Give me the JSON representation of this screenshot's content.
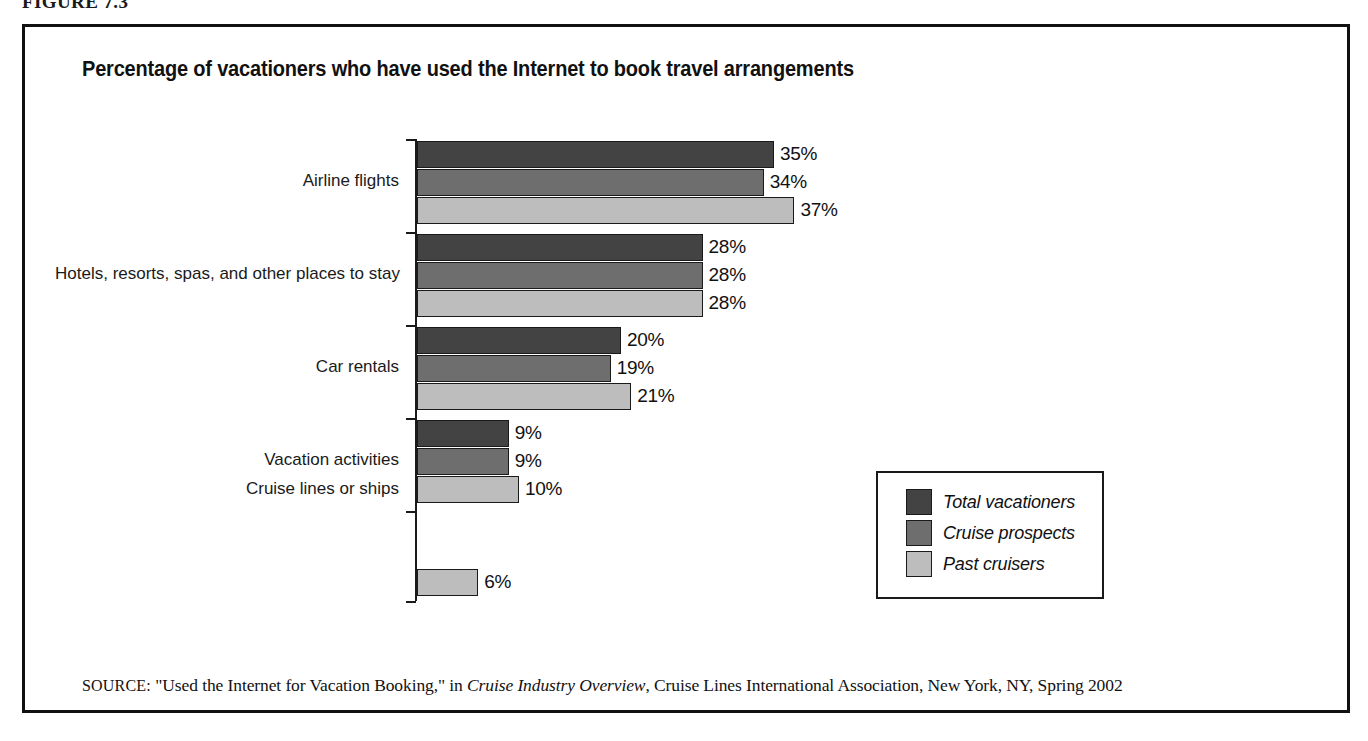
{
  "figure": {
    "number": "FIGURE 7.3"
  },
  "chart_data": {
    "type": "bar",
    "orientation": "horizontal",
    "title": "Percentage of vacationers who have used the Internet to book travel arrangements",
    "xlabel": "",
    "ylabel": "",
    "xlim": [
      0,
      40
    ],
    "grid": false,
    "value_suffix": "%",
    "legend_position": "inside-right",
    "categories": [
      "Airline flights",
      "Hotels, resorts, spas, and other places to stay",
      "Car rentals",
      "Vacation activities",
      "Cruise lines or ships"
    ],
    "series": [
      {
        "name": "Total vacationers",
        "color": "#434343",
        "values": [
          35,
          28,
          20,
          9,
          null
        ],
        "labels": [
          "35%",
          "28%",
          "20%",
          "9%",
          ""
        ]
      },
      {
        "name": "Cruise prospects",
        "color": "#6e6e6e",
        "values": [
          34,
          28,
          19,
          9,
          null
        ],
        "labels": [
          "34%",
          "28%",
          "19%",
          "9%",
          ""
        ]
      },
      {
        "name": "Past cruisers",
        "color": "#bdbdbd",
        "values": [
          37,
          28,
          21,
          10,
          6
        ],
        "labels": [
          "37%",
          "28%",
          "21%",
          "10%",
          "6%"
        ]
      }
    ]
  },
  "legend": {
    "items": [
      {
        "label": "Total vacationers",
        "color": "#434343"
      },
      {
        "label": "Cruise prospects",
        "color": "#6e6e6e"
      },
      {
        "label": "Past cruisers",
        "color": "#bdbdbd"
      }
    ]
  },
  "source": {
    "label": "SOURCE:",
    "text_before": " \"Used the Internet for Vacation Booking,\" in ",
    "publication": "Cruise Industry Overview",
    "text_after": ", Cruise Lines International Association, New York, NY, Spring 2002"
  }
}
